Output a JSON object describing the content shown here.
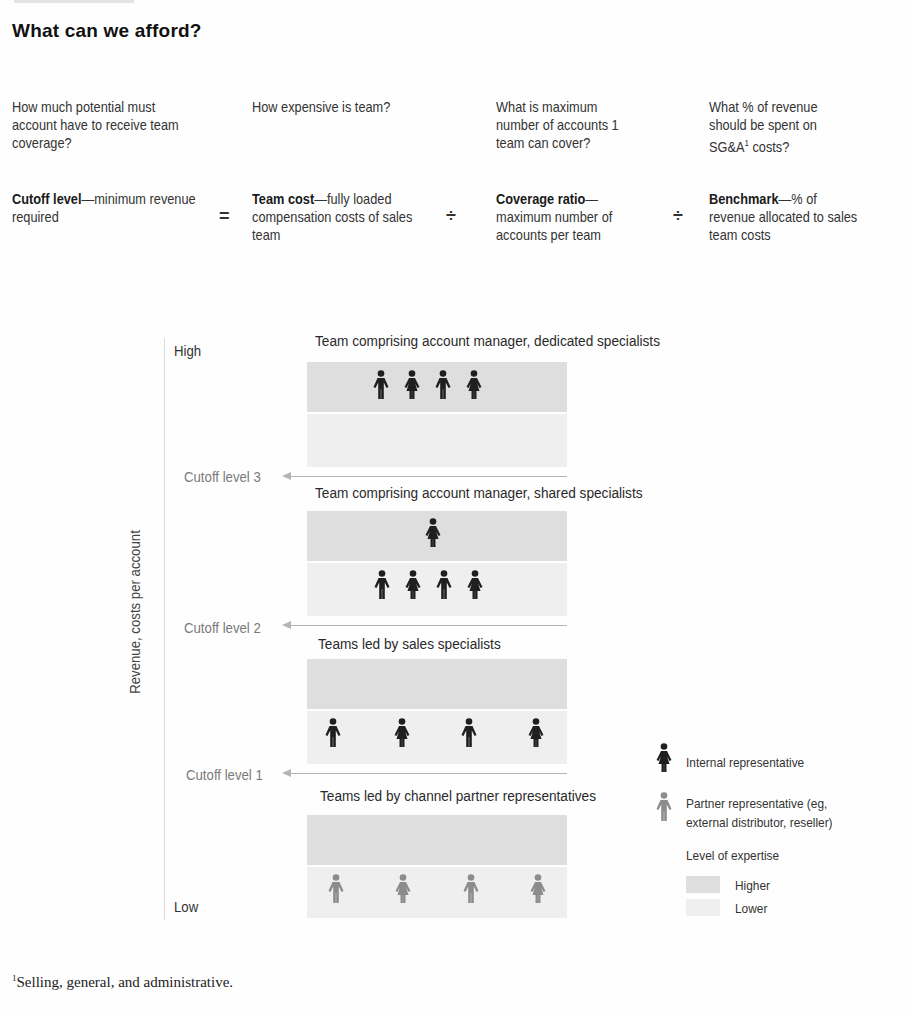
{
  "title": "What can we afford?",
  "formula": {
    "columns": [
      {
        "question": "How much potential must account have to receive team coverage?",
        "term": "Cutoff level",
        "definition": "—minimum revenue required"
      },
      {
        "question": "How expensive is team?",
        "term": "Team cost",
        "definition": "—fully loaded compensation costs of sales team"
      },
      {
        "question": "What is maximum number of accounts 1 team can cover?",
        "term": "Coverage ratio",
        "definition": "— maximum number of accounts per team"
      },
      {
        "question_prefix": "What % of revenue should be spent on SG&A",
        "question_sup": "1",
        "question_suffix": " costs?",
        "term": "Benchmark",
        "definition": "—% of revenue allocated to sales team costs"
      }
    ],
    "operators": [
      "=",
      "÷",
      "÷"
    ]
  },
  "diagram": {
    "y_axis_label": "Revenue, costs per account",
    "axis_high": "High",
    "axis_low": "Low",
    "lanes": [
      {
        "title": "Team comprising account manager, dedicated specialists",
        "higher_expertise_people": [
          {
            "type": "internal",
            "gender": "male"
          },
          {
            "type": "internal",
            "gender": "female"
          },
          {
            "type": "internal",
            "gender": "male"
          },
          {
            "type": "internal",
            "gender": "female"
          }
        ],
        "lower_expertise_people": []
      },
      {
        "title": "Team comprising account manager, shared specialists",
        "higher_expertise_people": [
          {
            "type": "internal",
            "gender": "female"
          }
        ],
        "lower_expertise_people": [
          {
            "type": "internal",
            "gender": "male"
          },
          {
            "type": "internal",
            "gender": "female"
          },
          {
            "type": "internal",
            "gender": "male"
          },
          {
            "type": "internal",
            "gender": "female"
          }
        ]
      },
      {
        "title": "Teams led by sales specialists",
        "higher_expertise_people": [],
        "lower_expertise_people": [
          {
            "type": "internal",
            "gender": "male"
          },
          {
            "type": "internal",
            "gender": "female"
          },
          {
            "type": "internal",
            "gender": "male"
          },
          {
            "type": "internal",
            "gender": "female"
          }
        ]
      },
      {
        "title": "Teams led by channel partner representatives",
        "higher_expertise_people": [],
        "lower_expertise_people": [
          {
            "type": "partner",
            "gender": "male"
          },
          {
            "type": "partner",
            "gender": "female"
          },
          {
            "type": "partner",
            "gender": "male"
          },
          {
            "type": "partner",
            "gender": "female"
          }
        ]
      }
    ],
    "cutoffs": [
      "Cutoff level 3",
      "Cutoff level 2",
      "Cutoff level 1"
    ]
  },
  "legend": {
    "internal": "Internal representative",
    "partner_line1": "Partner representative (eg,",
    "partner_line2": "external distributor, reseller)",
    "expertise_title": "Level of expertise",
    "higher": "Higher",
    "lower": "Lower"
  },
  "colors": {
    "internal_figure": "#1f1f1f",
    "partner_figure": "#8c8c8c",
    "higher_band": "#dedede",
    "lower_band": "#efefef",
    "cutoff_arrow": "#b5b5b5"
  },
  "footnote": {
    "marker": "1",
    "text": "Selling, general, and administrative."
  }
}
